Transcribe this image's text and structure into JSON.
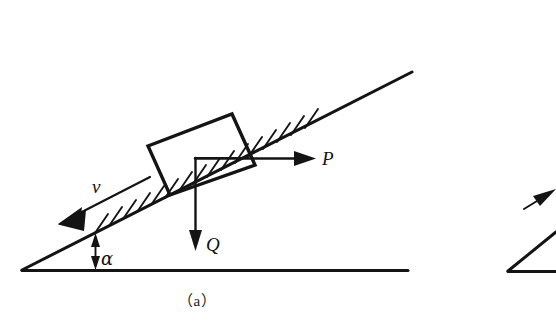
{
  "figure": {
    "caption": "（a）",
    "background_color": "#ffffff",
    "ink_color": "#141414",
    "labels": {
      "velocity": "v",
      "applied_force": "P",
      "weight": "Q",
      "angle": "α"
    },
    "elements": {
      "incline_surface": "incline-line",
      "ground_line": "ground-line",
      "block": "block-rectangle",
      "hatching": "surface-hatching",
      "velocity_arrow": "velocity-arrow",
      "force_arrow": "force-arrow-p",
      "weight_arrow": "weight-arrow-q",
      "angle_marker": "angle-marker-alpha",
      "corner_bracket": "force-corner-bracket",
      "partial_figure_b": "partial-figure-b"
    },
    "geometry": {
      "incline_start": [
        22,
        270
      ],
      "incline_end": [
        412,
        72
      ],
      "ground_start": [
        22,
        270
      ],
      "ground_end": [
        408,
        270
      ],
      "block_corners": [
        [
          148,
          146
        ],
        [
          232,
          114
        ],
        [
          255,
          165
        ],
        [
          170,
          195
        ]
      ],
      "velocity_arrow_from": [
        150,
        177
      ],
      "velocity_arrow_to": [
        60,
        223
      ],
      "force_p_from": [
        248,
        158
      ],
      "force_p_to": [
        316,
        158
      ],
      "weight_q_from": [
        195,
        158
      ],
      "weight_q_to": [
        195,
        249
      ],
      "angle_marker_x": 95,
      "angle_marker_top": 233,
      "angle_marker_bottom": 270
    }
  }
}
